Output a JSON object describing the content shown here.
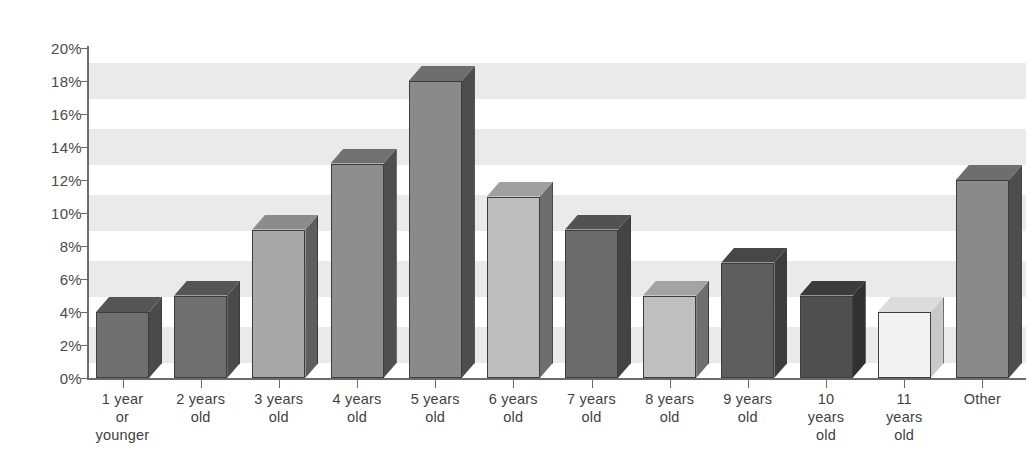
{
  "chart_data": {
    "type": "bar",
    "title": "",
    "subtitle": "",
    "xlabel": "",
    "ylabel": "",
    "ylim": [
      0,
      20
    ],
    "ytick_suffix": "%",
    "yticks": [
      0,
      2,
      4,
      6,
      8,
      10,
      12,
      14,
      16,
      18,
      20
    ],
    "ytick_labels": [
      "0%",
      "2%",
      "4%",
      "6%",
      "8%",
      "10%",
      "12%",
      "14%",
      "16%",
      "18%",
      "20%"
    ],
    "grid": false,
    "background_bands": true,
    "legend": "none",
    "style": "3d-bars-grayscale",
    "categories": [
      "1 year or younger",
      "2 years old",
      "3 years old",
      "4 years old",
      "5 years old",
      "6 years old",
      "7 years old",
      "8 years old",
      "9 years old",
      "10 years old",
      "11 years old",
      "Other"
    ],
    "category_label_lines": [
      [
        "1 year",
        "or",
        "younger"
      ],
      [
        "2 years",
        "old"
      ],
      [
        "3 years",
        "old"
      ],
      [
        "4 years",
        "old"
      ],
      [
        "5 years",
        "old"
      ],
      [
        "6 years",
        "old"
      ],
      [
        "7 years",
        "old"
      ],
      [
        "8 years",
        "old"
      ],
      [
        "9 years",
        "old"
      ],
      [
        "10",
        "years",
        "old"
      ],
      [
        "11",
        "years",
        "old"
      ],
      [
        "Other"
      ]
    ],
    "values": [
      4,
      5,
      9,
      13,
      18,
      11,
      9,
      5,
      7,
      5,
      4,
      12
    ],
    "bar_colors": [
      "#6f6f6f",
      "#6f6f6f",
      "#a8a8a8",
      "#8e8e8e",
      "#8a8a8a",
      "#bdbdbd",
      "#6b6b6b",
      "#bfbfbf",
      "#5e5e5e",
      "#4f4f4f",
      "#f2f2f2",
      "#8a8a8a"
    ],
    "bar_top_colors": [
      "#555555",
      "#555555",
      "#8c8c8c",
      "#717171",
      "#6e6e6e",
      "#a0a0a0",
      "#525252",
      "#a3a3a3",
      "#474747",
      "#3b3b3b",
      "#dcdcdc",
      "#6e6e6e"
    ],
    "bar_side_colors": [
      "#4a4a4a",
      "#4a4a4a",
      "#5e5e5e",
      "#4f4f4f",
      "#4d4d4d",
      "#6e6e6e",
      "#434343",
      "#6f6f6f",
      "#3c3c3c",
      "#313131",
      "#c8c8c8",
      "#4d4d4d"
    ]
  },
  "axis": {
    "y_axis_name": "percent-axis",
    "x_axis_name": "age-category-axis"
  }
}
